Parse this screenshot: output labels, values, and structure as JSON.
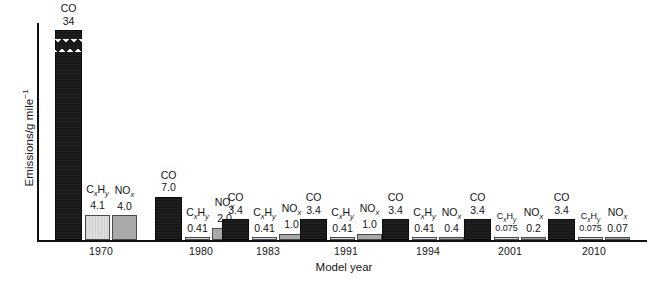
{
  "chart_data": {
    "type": "bar",
    "title": "",
    "xlabel": "Model year",
    "ylabel": "Emissions/g mile⁻¹",
    "categories": [
      "1970",
      "1980",
      "1983",
      "1991",
      "1994",
      "2001",
      "2010"
    ],
    "grid": false,
    "legend": "none (bars labelled in place)",
    "ylim": [
      0,
      34
    ],
    "series": [
      {
        "name": "CO",
        "values": [
          34,
          7.0,
          3.4,
          3.4,
          3.4,
          3.4,
          3.4
        ]
      },
      {
        "name": "CxHy",
        "values": [
          4.1,
          0.41,
          0.41,
          0.41,
          0.41,
          0.075,
          0.075
        ]
      },
      {
        "name": "NOx",
        "values": [
          4.0,
          2.0,
          1.0,
          1.0,
          0.4,
          0.2,
          0.07
        ]
      }
    ],
    "value_labels": {
      "CO": [
        "34",
        "7.0",
        "3.4",
        "3.4",
        "3.4",
        "3.4",
        "3.4"
      ],
      "CxHy": [
        "4.1",
        "0.41",
        "0.41",
        "0.41",
        "0.41",
        "0.075",
        "0.075"
      ],
      "NOx": [
        "4.0",
        "2.0",
        "1.0",
        "1.0",
        "0.4",
        "0.2",
        "0.07"
      ]
    },
    "annotations": [
      "Tallest CO bar (1970, 34) is drawn with a broken/torn top to indicate a scale break."
    ]
  },
  "axes": {
    "y_title": "Emissions/g mile",
    "y_title_exponent": "−1",
    "x_title": "Model year"
  },
  "species": {
    "co": {
      "label": "CO",
      "color": "#191919"
    },
    "hc": {
      "label_pre": "C",
      "label_sub1": "x",
      "label_mid": "H",
      "label_sub2": "y",
      "color": "#dedede"
    },
    "nox": {
      "label_pre": "NO",
      "label_sub": "x",
      "color": "#a9a9a9"
    }
  },
  "groups": [
    {
      "year": "1970",
      "bars": [
        {
          "species": "CO",
          "value_label": "34",
          "value": 34
        },
        {
          "species": "CxHy",
          "value_label": "4.1",
          "value": 4.1
        },
        {
          "species": "NOx",
          "value_label": "4.0",
          "value": 4.0
        }
      ]
    },
    {
      "year": "1980",
      "bars": [
        {
          "species": "CO",
          "value_label": "7.0",
          "value": 7.0
        },
        {
          "species": "CxHy",
          "value_label": "0.41",
          "value": 0.41
        },
        {
          "species": "NOx",
          "value_label": "2.0",
          "value": 2.0
        }
      ]
    },
    {
      "year": "1983",
      "bars": [
        {
          "species": "CO",
          "value_label": "3.4",
          "value": 3.4
        },
        {
          "species": "CxHy",
          "value_label": "0.41",
          "value": 0.41
        },
        {
          "species": "NOx",
          "value_label": "1.0",
          "value": 1.0
        }
      ]
    },
    {
      "year": "1991",
      "bars": [
        {
          "species": "CO",
          "value_label": "3.4",
          "value": 3.4
        },
        {
          "species": "CxHy",
          "value_label": "0.41",
          "value": 0.41
        },
        {
          "species": "NOx",
          "value_label": "1.0",
          "value": 1.0
        }
      ]
    },
    {
      "year": "1994",
      "bars": [
        {
          "species": "CO",
          "value_label": "3.4",
          "value": 3.4
        },
        {
          "species": "CxHy",
          "value_label": "0.41",
          "value": 0.41
        },
        {
          "species": "NOx",
          "value_label": "0.4",
          "value": 0.4
        }
      ]
    },
    {
      "year": "2001",
      "bars": [
        {
          "species": "CO",
          "value_label": "3.4",
          "value": 3.4
        },
        {
          "species": "CxHy",
          "value_label": "0.075",
          "value": 0.075
        },
        {
          "species": "NOx",
          "value_label": "0.2",
          "value": 0.2
        }
      ]
    },
    {
      "year": "2010",
      "bars": [
        {
          "species": "CO",
          "value_label": "3.4",
          "value": 3.4
        },
        {
          "species": "CxHy",
          "value_label": "0.075",
          "value": 0.075
        },
        {
          "species": "NOx",
          "value_label": "0.07",
          "value": 0.07
        }
      ]
    }
  ]
}
